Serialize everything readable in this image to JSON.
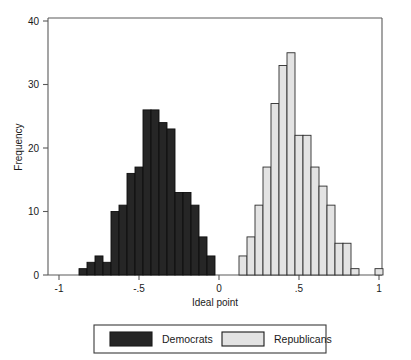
{
  "chart_data": {
    "type": "bar",
    "title": "",
    "subtitle": "",
    "xlabel": "Ideal point",
    "ylabel": "Frequency",
    "xlim": [
      -1,
      1
    ],
    "ylim": [
      0,
      40
    ],
    "xticks": [
      -1,
      -0.5,
      0,
      0.5,
      1
    ],
    "xtick_labels": [
      "-1",
      "-.5",
      "0",
      ".5",
      "1"
    ],
    "yticks": [
      0,
      10,
      20,
      30,
      40
    ],
    "ytick_labels": [
      "0",
      "10",
      "20",
      "30",
      "40"
    ],
    "grid": false,
    "legend_position": "below",
    "bin_width": 0.05,
    "series": [
      {
        "name": "Democrats",
        "color": "#262626",
        "bins": [
          {
            "x0": -0.875,
            "x1": -0.825,
            "value": 1
          },
          {
            "x0": -0.825,
            "x1": -0.775,
            "value": 2
          },
          {
            "x0": -0.775,
            "x1": -0.725,
            "value": 3
          },
          {
            "x0": -0.725,
            "x1": -0.675,
            "value": 2
          },
          {
            "x0": -0.675,
            "x1": -0.625,
            "value": 10
          },
          {
            "x0": -0.625,
            "x1": -0.575,
            "value": 11
          },
          {
            "x0": -0.575,
            "x1": -0.525,
            "value": 16
          },
          {
            "x0": -0.525,
            "x1": -0.475,
            "value": 17
          },
          {
            "x0": -0.475,
            "x1": -0.425,
            "value": 26
          },
          {
            "x0": -0.425,
            "x1": -0.375,
            "value": 26
          },
          {
            "x0": -0.375,
            "x1": -0.325,
            "value": 24
          },
          {
            "x0": -0.325,
            "x1": -0.275,
            "value": 23
          },
          {
            "x0": -0.275,
            "x1": -0.225,
            "value": 13
          },
          {
            "x0": -0.225,
            "x1": -0.175,
            "value": 13
          },
          {
            "x0": -0.175,
            "x1": -0.125,
            "value": 11
          },
          {
            "x0": -0.125,
            "x1": -0.075,
            "value": 6
          },
          {
            "x0": -0.075,
            "x1": -0.025,
            "value": 3
          }
        ]
      },
      {
        "name": "Republicans",
        "color": "#e3e3e3",
        "bins": [
          {
            "x0": 0.125,
            "x1": 0.175,
            "value": 3
          },
          {
            "x0": 0.175,
            "x1": 0.225,
            "value": 6
          },
          {
            "x0": 0.225,
            "x1": 0.275,
            "value": 11
          },
          {
            "x0": 0.275,
            "x1": 0.325,
            "value": 17
          },
          {
            "x0": 0.325,
            "x1": 0.375,
            "value": 27
          },
          {
            "x0": 0.375,
            "x1": 0.425,
            "value": 33
          },
          {
            "x0": 0.425,
            "x1": 0.475,
            "value": 35
          },
          {
            "x0": 0.475,
            "x1": 0.525,
            "value": 22
          },
          {
            "x0": 0.525,
            "x1": 0.575,
            "value": 22
          },
          {
            "x0": 0.575,
            "x1": 0.625,
            "value": 17
          },
          {
            "x0": 0.625,
            "x1": 0.675,
            "value": 14
          },
          {
            "x0": 0.675,
            "x1": 0.725,
            "value": 11
          },
          {
            "x0": 0.725,
            "x1": 0.775,
            "value": 5
          },
          {
            "x0": 0.775,
            "x1": 0.825,
            "value": 5
          },
          {
            "x0": 0.825,
            "x1": 0.875,
            "value": 1
          },
          {
            "x0": 0.975,
            "x1": 1.025,
            "value": 1
          }
        ]
      }
    ],
    "legend": [
      {
        "label": "Democrats",
        "color": "#262626"
      },
      {
        "label": "Republicans",
        "color": "#e3e3e3"
      }
    ]
  }
}
